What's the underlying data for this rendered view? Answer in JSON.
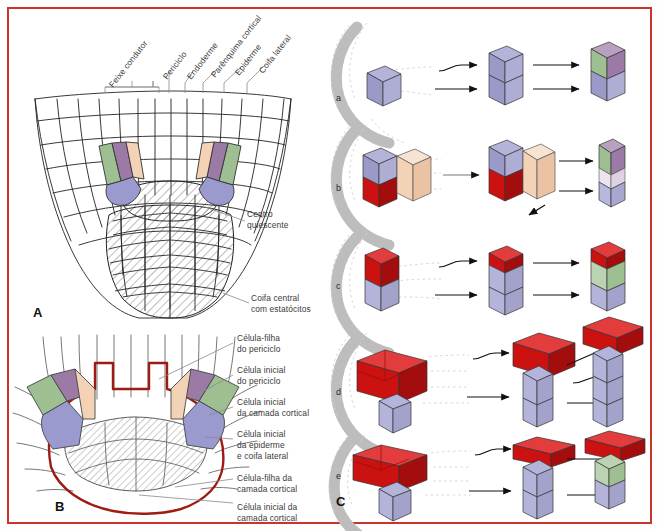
{
  "figure": {
    "border_color": "#c9352c",
    "background": "#ffffff"
  },
  "palette": {
    "green": "#9dbf92",
    "mauve": "#9b7ba5",
    "peach": "#f3d2b6",
    "blueviolet": "#9a9ace",
    "red": "#cc1111",
    "red_dark": "#8e0f0f",
    "outline_red": "#9e1b12",
    "gray_arc": "#bdbdbd",
    "line": "#2b2b2b",
    "text": "#3a3a3a"
  },
  "panelA": {
    "letter": "A",
    "tissue_labels": [
      {
        "id": "feixe-condutor",
        "text": "Feixe condutor"
      },
      {
        "id": "periciclo",
        "text": "Periciclo"
      },
      {
        "id": "endoderme",
        "text": "Endoderme"
      },
      {
        "id": "parenquima-cortical",
        "text": "Parênquima cortical"
      },
      {
        "id": "epiderme",
        "text": "Epiderme"
      },
      {
        "id": "coifa-lateral",
        "text": "Coifa lateral"
      }
    ],
    "callouts": [
      {
        "id": "centro-quiescente",
        "line1": "Centro",
        "line2": "quiescente"
      },
      {
        "id": "coifa-central",
        "line1": "Coifa central",
        "line2": "com estatócitos"
      }
    ]
  },
  "panelB": {
    "letter": "B",
    "callouts": [
      {
        "id": "celula-filha-periciclo",
        "line1": "Célula-filha",
        "line2": "do periciclo"
      },
      {
        "id": "celula-inicial-periciclo",
        "line1": "Célula inicial",
        "line2": "do periciclo"
      },
      {
        "id": "celula-inicial-camada-cortical",
        "line1": "Célula inicial",
        "line2": "da camada cortical"
      },
      {
        "id": "celula-inicial-epiderme",
        "line1": "Célula inicial",
        "line2": "da epiderme",
        "line3": "e coifa lateral"
      },
      {
        "id": "celula-filha-camada-cortical",
        "line1": "Célula-filha da",
        "line2": "camada cortical"
      },
      {
        "id": "celula-inicial-camada-cortical-2",
        "line1": "Célula inicial da",
        "line2": "camada cortical"
      }
    ]
  },
  "panelC": {
    "letter": "C",
    "rows": [
      {
        "id": "row-a",
        "label": "a",
        "stages": 3
      },
      {
        "id": "row-b",
        "label": "b",
        "stages": 4
      },
      {
        "id": "row-c",
        "label": "c",
        "stages": 3
      },
      {
        "id": "row-d",
        "label": "d",
        "stages": 3
      },
      {
        "id": "row-e",
        "label": "e",
        "stages": 3
      }
    ]
  }
}
